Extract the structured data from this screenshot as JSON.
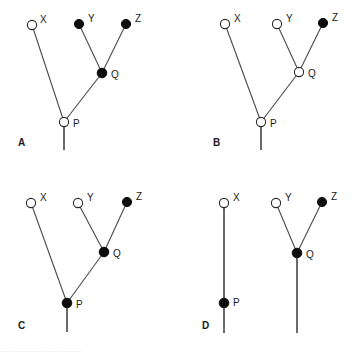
{
  "figure": {
    "type": "phylogenetic-character-state-diagram",
    "width": 357,
    "height": 353,
    "background": "#ffffff",
    "colors": {
      "branch": "#4a4a4a",
      "stem": "#6a6a6a",
      "node_filled": "#0d0d0d",
      "node_open_fill": "#ffffff",
      "node_open_stroke": "#2a2a2a",
      "text": "#1a1a1a"
    },
    "legend_note": "open circle = ancestral/absent state; filled circle = derived/present state",
    "node_radius": 4.6,
    "panels": [
      {
        "id": "A",
        "label": "A",
        "label_pos": {
          "x": 18,
          "y": 146
        },
        "root_stem": {
          "x": 64,
          "y1": 127,
          "y2": 150
        },
        "nodes": [
          {
            "name": "X",
            "state": "open",
            "x": 32,
            "y": 25,
            "label": "X",
            "label_pos": {
              "x": 40,
              "y": 23
            }
          },
          {
            "name": "Y",
            "state": "filled",
            "x": 79,
            "y": 24,
            "label": "Y",
            "label_pos": {
              "x": 88,
              "y": 22
            }
          },
          {
            "name": "Z",
            "state": "filled",
            "x": 126,
            "y": 24,
            "label": "Z",
            "label_pos": {
              "x": 135,
              "y": 22
            }
          },
          {
            "name": "Q",
            "state": "filled",
            "x": 102,
            "y": 73,
            "label": "Q",
            "label_pos": {
              "x": 111,
              "y": 78
            }
          },
          {
            "name": "P",
            "state": "open",
            "x": 64,
            "y": 122,
            "label": "P",
            "label_pos": {
              "x": 73,
              "y": 127
            }
          }
        ],
        "branches": [
          {
            "from": "P",
            "to": "X"
          },
          {
            "from": "P",
            "to": "Q"
          },
          {
            "from": "Q",
            "to": "Y"
          },
          {
            "from": "Q",
            "to": "Z"
          }
        ]
      },
      {
        "id": "B",
        "label": "B",
        "label_pos": {
          "x": 213,
          "y": 146
        },
        "root_stem": {
          "x": 261,
          "y1": 127,
          "y2": 150
        },
        "nodes": [
          {
            "name": "X",
            "state": "open",
            "x": 225,
            "y": 24,
            "label": "X",
            "label_pos": {
              "x": 234,
              "y": 22
            }
          },
          {
            "name": "Y",
            "state": "open",
            "x": 277,
            "y": 24,
            "label": "Y",
            "label_pos": {
              "x": 286,
              "y": 22
            }
          },
          {
            "name": "Z",
            "state": "filled",
            "x": 323,
            "y": 23,
            "label": "Z",
            "label_pos": {
              "x": 332,
              "y": 21
            }
          },
          {
            "name": "Q",
            "state": "open",
            "x": 299,
            "y": 72,
            "label": "Q",
            "label_pos": {
              "x": 308,
              "y": 77
            }
          },
          {
            "name": "P",
            "state": "open",
            "x": 261,
            "y": 122,
            "label": "P",
            "label_pos": {
              "x": 270,
              "y": 127
            }
          }
        ],
        "branches": [
          {
            "from": "P",
            "to": "X"
          },
          {
            "from": "P",
            "to": "Q"
          },
          {
            "from": "Q",
            "to": "Y"
          },
          {
            "from": "Q",
            "to": "Z"
          }
        ]
      },
      {
        "id": "C",
        "label": "C",
        "label_pos": {
          "x": 18,
          "y": 329
        },
        "root_stem": {
          "x": 67,
          "y1": 308,
          "y2": 332
        },
        "nodes": [
          {
            "name": "X",
            "state": "open",
            "x": 31,
            "y": 203,
            "label": "X",
            "label_pos": {
              "x": 40,
              "y": 201
            }
          },
          {
            "name": "Y",
            "state": "open",
            "x": 78,
            "y": 203,
            "label": "Y",
            "label_pos": {
              "x": 87,
              "y": 201
            }
          },
          {
            "name": "Z",
            "state": "filled",
            "x": 127,
            "y": 202,
            "label": "Z",
            "label_pos": {
              "x": 136,
              "y": 200
            }
          },
          {
            "name": "Q",
            "state": "filled",
            "x": 104,
            "y": 252,
            "label": "Q",
            "label_pos": {
              "x": 113,
              "y": 257
            }
          },
          {
            "name": "P",
            "state": "filled",
            "x": 67,
            "y": 303,
            "label": "P",
            "label_pos": {
              "x": 76,
              "y": 308
            }
          }
        ],
        "branches": [
          {
            "from": "P",
            "to": "X"
          },
          {
            "from": "P",
            "to": "Q"
          },
          {
            "from": "Q",
            "to": "Y"
          },
          {
            "from": "Q",
            "to": "Z"
          }
        ]
      },
      {
        "id": "D",
        "label": "D",
        "label_pos": {
          "x": 202,
          "y": 329
        },
        "lineages": [
          {
            "name": "left-lineage",
            "vertical": {
              "x": 224,
              "y1": 203,
              "y2": 333
            },
            "nodes": [
              {
                "name": "X",
                "state": "open",
                "x": 224,
                "y": 203,
                "label": "X",
                "label_pos": {
                  "x": 233,
                  "y": 201
                }
              },
              {
                "name": "P",
                "state": "filled",
                "x": 224,
                "y": 303,
                "label": "P",
                "label_pos": {
                  "x": 233,
                  "y": 306
                }
              }
            ]
          },
          {
            "name": "right-lineage",
            "vertical": {
              "x": 297,
              "y1": 253,
              "y2": 333
            },
            "nodes": [
              {
                "name": "Y",
                "state": "open",
                "x": 276,
                "y": 203,
                "label": "Y",
                "label_pos": {
                  "x": 285,
                  "y": 201
                }
              },
              {
                "name": "Z",
                "state": "filled",
                "x": 322,
                "y": 202,
                "label": "Z",
                "label_pos": {
                  "x": 331,
                  "y": 200
                }
              },
              {
                "name": "Q",
                "state": "filled",
                "x": 297,
                "y": 253,
                "label": "Q",
                "label_pos": {
                  "x": 306,
                  "y": 258
                }
              }
            ],
            "branches": [
              {
                "from": "Q",
                "to": "Y"
              },
              {
                "from": "Q",
                "to": "Z"
              }
            ]
          }
        ]
      }
    ],
    "clipped_caption": "............................."
  }
}
